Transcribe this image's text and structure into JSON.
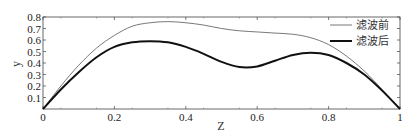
{
  "chart_data": {
    "type": "line",
    "title": "",
    "xlabel": "Z",
    "ylabel": "y",
    "xlim": [
      0,
      1
    ],
    "ylim": [
      0,
      0.8
    ],
    "xticks": [
      "0",
      "0.2",
      "0.4",
      "0.6",
      "0.8",
      "1"
    ],
    "yticks": [
      "0.1",
      "0.2",
      "0.3",
      "0.4",
      "0.5",
      "0.6",
      "0.7",
      "0.8"
    ],
    "grid": false,
    "legend_position": "upper right",
    "x": [
      0,
      0.05,
      0.1,
      0.15,
      0.2,
      0.25,
      0.3,
      0.35,
      0.4,
      0.45,
      0.5,
      0.55,
      0.6,
      0.65,
      0.7,
      0.75,
      0.8,
      0.85,
      0.9,
      0.95,
      1.0
    ],
    "series": [
      {
        "name": "滤波前",
        "style": "thin",
        "values": [
          0,
          0.2,
          0.38,
          0.53,
          0.64,
          0.72,
          0.75,
          0.76,
          0.75,
          0.73,
          0.7,
          0.68,
          0.67,
          0.66,
          0.65,
          0.62,
          0.56,
          0.46,
          0.33,
          0.17,
          0
        ]
      },
      {
        "name": "滤波后",
        "style": "thick",
        "values": [
          0,
          0.17,
          0.32,
          0.45,
          0.54,
          0.58,
          0.59,
          0.58,
          0.54,
          0.48,
          0.41,
          0.365,
          0.37,
          0.42,
          0.47,
          0.49,
          0.47,
          0.4,
          0.3,
          0.16,
          0
        ]
      }
    ]
  },
  "legend": {
    "items": [
      {
        "label": "滤波前"
      },
      {
        "label": "滤波后"
      }
    ]
  },
  "axes": {
    "xlabel": "Z",
    "ylabel": "y"
  }
}
